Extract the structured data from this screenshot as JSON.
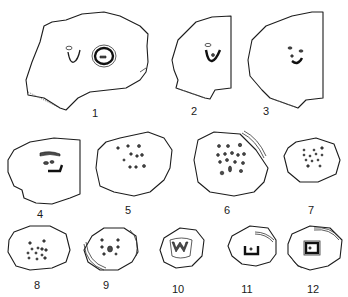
{
  "figure": {
    "panels": [
      {
        "id": 1,
        "label": "1",
        "description": "irregular section with U-shaped trace and large ring-shaped bundle"
      },
      {
        "id": 2,
        "label": "2",
        "description": "truncated section with U-shaped trace"
      },
      {
        "id": 3,
        "label": "3",
        "description": "truncated section with curved row of bundles"
      },
      {
        "id": 4,
        "label": "4",
        "description": "truncated section with C-shaped bundle arrangement"
      },
      {
        "id": 5,
        "label": "5",
        "description": "rounded section with scattered bundles"
      },
      {
        "id": 6,
        "label": "6",
        "description": "rounded section with many scattered bundles"
      },
      {
        "id": 7,
        "label": "7",
        "description": "rounded section with scattered small bundles"
      },
      {
        "id": 8,
        "label": "8",
        "description": "rounded section with clustered bundles"
      },
      {
        "id": 9,
        "label": "9",
        "description": "rounded section with clustered bundles and leaf sheath"
      },
      {
        "id": 10,
        "label": "10",
        "description": "rounded section with W-shaped central bundle"
      },
      {
        "id": 11,
        "label": "11",
        "description": "rounded section with cup-shaped central bundle and sheath"
      },
      {
        "id": 12,
        "label": "12",
        "description": "rounded section with square central bundle and sheaths"
      }
    ],
    "colors": {
      "line": "#1c1c1c",
      "background": "#ffffff"
    }
  }
}
